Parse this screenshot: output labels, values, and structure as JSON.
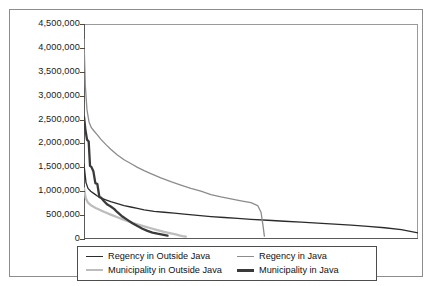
{
  "chart_data": {
    "type": "line",
    "title": "",
    "xlabel": "",
    "ylabel": "",
    "grid": false,
    "legend_position": "bottom",
    "ylim": [
      0,
      4500000
    ],
    "ytick_labels": [
      "4,500,000",
      "4,000,000",
      "3,500,000",
      "3,000,000",
      "2,500,000",
      "2,000,000",
      "1,500,000",
      "1,000,000",
      "500,000",
      "0"
    ],
    "ytick_values": [
      4500000,
      4000000,
      3500000,
      3000000,
      2500000,
      2000000,
      1500000,
      1000000,
      500000,
      0
    ],
    "xtick_labels": [],
    "xlim": [
      0,
      100
    ],
    "series": [
      {
        "name": "Regency in Outside Java",
        "color": "#2b2b2b",
        "width": 1.3,
        "x": [
          0.0,
          0.6,
          1.2,
          2.0,
          3.0,
          4.0,
          5.0,
          6.5,
          8.0,
          10.0,
          12.0,
          14.0,
          16.0,
          18.0,
          21.0,
          24.0,
          27.0,
          30.0,
          34.0,
          38.0,
          42.0,
          46.0,
          50.0,
          55.0,
          60.0,
          65.0,
          70.0,
          75.0,
          80.0,
          85.0,
          90.0,
          95.0,
          100.0
        ],
        "values": [
          1560000,
          1180000,
          1060000,
          1000000,
          950000,
          900000,
          860000,
          820000,
          780000,
          740000,
          700000,
          670000,
          640000,
          610000,
          580000,
          560000,
          540000,
          520000,
          495000,
          470000,
          450000,
          430000,
          412000,
          392000,
          372000,
          352000,
          332000,
          312000,
          290000,
          265000,
          235000,
          195000,
          130000
        ]
      },
      {
        "name": "Regency in Java",
        "color": "#8c8c8c",
        "width": 1.3,
        "x": [
          0.0,
          0.4,
          0.9,
          1.5,
          2.2,
          3.0,
          4.0,
          5.0,
          6.5,
          8.0,
          10.0,
          12.0,
          14.0,
          16.0,
          18.0,
          20.0,
          23.0,
          26.0,
          29.0,
          32.0,
          35.0,
          38.0,
          41.0,
          44.0,
          47.0,
          50.0,
          52.0,
          53.0,
          53.6,
          54.0
        ],
        "values": [
          4180000,
          3200000,
          2700000,
          2450000,
          2330000,
          2260000,
          2180000,
          2090000,
          1980000,
          1880000,
          1760000,
          1660000,
          1580000,
          1500000,
          1430000,
          1370000,
          1280000,
          1200000,
          1130000,
          1060000,
          1000000,
          930000,
          880000,
          840000,
          800000,
          760000,
          700000,
          560000,
          280000,
          60000
        ]
      },
      {
        "name": "Municipality in Outside Java",
        "color": "#bdbdbd",
        "width": 2.3,
        "x": [
          0.0,
          0.5,
          1.2,
          2.2,
          3.5,
          5.0,
          6.5,
          8.0,
          10.0,
          12.0,
          14.0,
          16.0,
          18.0,
          20.0,
          22.0,
          24.0,
          26.0,
          27.5,
          28.5,
          29.5,
          30.5
        ],
        "values": [
          1060000,
          860000,
          760000,
          700000,
          650000,
          600000,
          555000,
          510000,
          455000,
          400000,
          350000,
          305000,
          265000,
          225000,
          185000,
          150000,
          120000,
          95000,
          75000,
          60000,
          50000
        ]
      },
      {
        "name": "Municipality in Java",
        "color": "#3a3a3a",
        "width": 2.3,
        "x": [
          0.0,
          0.4,
          0.9,
          1.4,
          1.8,
          2.2,
          2.8,
          3.4,
          4.0,
          4.6,
          5.2,
          6.0,
          7.0,
          8.0,
          9.0,
          10.0,
          11.5,
          13.0,
          14.5,
          16.0,
          17.5,
          19.0,
          20.5,
          22.0,
          23.5,
          25.0
        ],
        "values": [
          2560000,
          2300000,
          2080000,
          2040000,
          1530000,
          1510000,
          1420000,
          1170000,
          1150000,
          880000,
          860000,
          790000,
          720000,
          680000,
          630000,
          560000,
          470000,
          400000,
          330000,
          270000,
          215000,
          170000,
          135000,
          110000,
          90000,
          70000
        ]
      }
    ],
    "legend": [
      {
        "label": "Regency in Outside Java",
        "color": "#2b2b2b",
        "width": 1.6
      },
      {
        "label": "Regency in Java",
        "color": "#8c8c8c",
        "width": 1.6
      },
      {
        "label": "Municipality in Outside Java",
        "color": "#bdbdbd",
        "width": 2.6
      },
      {
        "label": "Municipality in Java",
        "color": "#3a3a3a",
        "width": 3.0
      }
    ]
  }
}
